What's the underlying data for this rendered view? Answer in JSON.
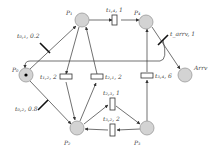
{
  "diagram": {
    "type": "petri-net",
    "places": [
      {
        "id": "P0",
        "label": "P₀",
        "tokens": 1
      },
      {
        "id": "P1",
        "label": "P₁",
        "tokens": 0
      },
      {
        "id": "P2",
        "label": "P₂",
        "tokens": 0
      },
      {
        "id": "P3",
        "label": "P₃",
        "tokens": 0
      },
      {
        "id": "P4",
        "label": "P₄",
        "tokens": 0
      },
      {
        "id": "Arrv",
        "label": "Arrv",
        "tokens": 0
      }
    ],
    "transitions": [
      {
        "id": "t01",
        "label": "t₀,₁, 0.2",
        "kind": "immediate",
        "from": "P0",
        "to": "P1"
      },
      {
        "id": "t02",
        "label": "t₀,₂, 0.8",
        "kind": "immediate",
        "from": "P0",
        "to": "P2"
      },
      {
        "id": "t14",
        "label": "t₁,₄, 1",
        "kind": "timed",
        "from": "P1",
        "to": "P4"
      },
      {
        "id": "t12",
        "label": "t₁,₂, 2",
        "kind": "timed",
        "from": "P1",
        "to": "P2"
      },
      {
        "id": "t21",
        "label": "t₂,₁, 2",
        "kind": "timed",
        "from": "P2",
        "to": "P1"
      },
      {
        "id": "t23",
        "label": "t₂,₃, 1",
        "kind": "timed",
        "from": "P2",
        "to": "P3"
      },
      {
        "id": "t32",
        "label": "t₃,₂, 2",
        "kind": "timed",
        "from": "P3",
        "to": "P2"
      },
      {
        "id": "t34",
        "label": "t₃,₄, 6",
        "kind": "timed",
        "from": "P3",
        "to": "P4"
      },
      {
        "id": "tarrv",
        "label": "t_arrv, 1",
        "kind": "immediate",
        "from": "P4",
        "to": "Arrv"
      }
    ],
    "colors": {
      "place_fill": "#d3d3d3",
      "arc": "#333333",
      "token": "#000000"
    }
  }
}
